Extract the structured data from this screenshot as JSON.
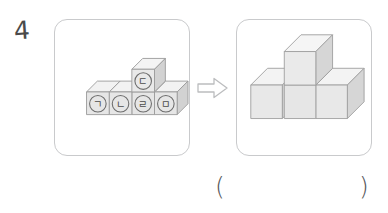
{
  "question": {
    "number": "4",
    "answer_open_paren": "(",
    "answer_close_paren": ")"
  },
  "arrow": {
    "name": "transform-arrow",
    "direction": "right",
    "glyph": "⇨"
  },
  "colors": {
    "panel_border": "#c9cacc",
    "cube_front": "#e6e6e6",
    "cube_top": "#f2f2f2",
    "cube_side": "#d5d5d5",
    "cube_outline": "#9a9a9a",
    "text": "#4a4a4a",
    "arrow_stroke": "#b9babc"
  },
  "left_panel": {
    "title": "labelled-cube-figure",
    "description": "Four unit cubes in a row with one cube stacked on top of the third from the left",
    "cube_labels": [
      {
        "id": "cube-a",
        "label": "㉠",
        "korean": "ㄱ",
        "position": "row-1"
      },
      {
        "id": "cube-b",
        "label": "㉡",
        "korean": "ㄴ",
        "position": "row-2"
      },
      {
        "id": "cube-c",
        "label": "㉢",
        "korean": "ㄷ",
        "position": "stacked-on-row-3"
      },
      {
        "id": "cube-d",
        "label": "㉣",
        "korean": "ㄹ",
        "position": "row-3"
      },
      {
        "id": "cube-e",
        "label": "㉤",
        "korean": "ㅁ",
        "position": "row-4"
      }
    ]
  },
  "right_panel": {
    "title": "target-cube-figure",
    "description": "T-shaped arrangement of four cubes with one cube raised at the junction"
  }
}
